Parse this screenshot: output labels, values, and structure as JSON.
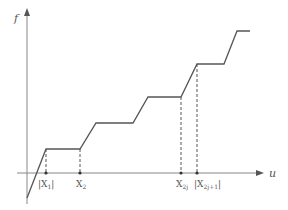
{
  "diagram": {
    "axes": {
      "y_label": "f",
      "x_label": "u"
    },
    "colors": {
      "axis": "#888888",
      "curve": "#555555",
      "dashed": "#555555",
      "text": "#555555"
    },
    "curve_points": [
      [
        27,
        198
      ],
      [
        46,
        149
      ],
      [
        80,
        149
      ],
      [
        96,
        123
      ],
      [
        133,
        123
      ],
      [
        148,
        97
      ],
      [
        181,
        97
      ],
      [
        197,
        64
      ],
      [
        224,
        64
      ],
      [
        237,
        31
      ],
      [
        250,
        31
      ]
    ],
    "markers": [
      {
        "id": "x1",
        "label": "|X",
        "sub": "1",
        "suffix": "|",
        "x": 46,
        "curve_y": 149
      },
      {
        "id": "x2",
        "label": "X",
        "sub": "2",
        "suffix": "",
        "x": 80,
        "curve_y": 149
      },
      {
        "id": "x2j",
        "label": "X",
        "sub": "2j",
        "suffix": "",
        "x": 181,
        "curve_y": 97
      },
      {
        "id": "x2j1",
        "label": "|X",
        "sub": "2j+1",
        "suffix": "|",
        "x": 197,
        "curve_y": 64
      }
    ]
  }
}
